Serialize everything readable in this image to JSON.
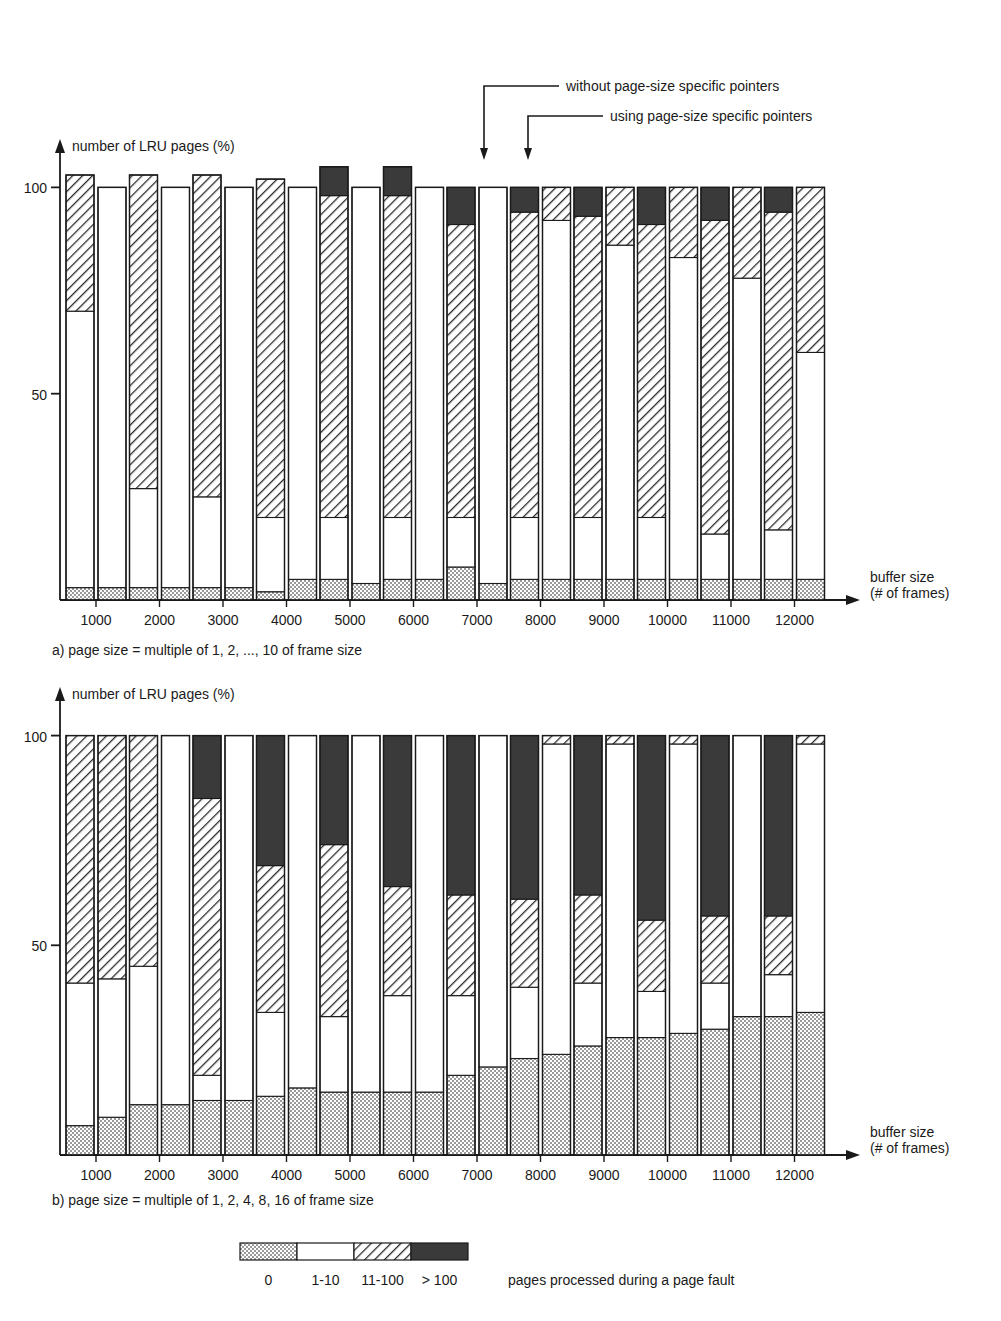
{
  "figure": {
    "annotations": [
      {
        "name": "without-pointers",
        "text": "without page-size specific pointers"
      },
      {
        "name": "using-pointers",
        "text": "using page-size specific pointers"
      }
    ],
    "legend": {
      "title": "pages processed during a page fault",
      "entries": [
        {
          "label": "0",
          "pattern": "dotted-gray",
          "color": "#bfbfbf"
        },
        {
          "label": "1-10",
          "pattern": "white",
          "color": "#ffffff"
        },
        {
          "label": "11-100",
          "pattern": "diagonal-hatch",
          "color": "#ffffff"
        },
        {
          "label": "> 100",
          "pattern": "solid-dark",
          "color": "#3a3a3a"
        }
      ]
    }
  },
  "chart_data": [
    {
      "id": "chart-a",
      "type": "bar",
      "subtype": "grouped-stacked",
      "title": "",
      "caption": "a) page size = multiple of 1, 2, ..., 10 of frame size",
      "ylabel": "number of LRU pages (%)",
      "xlabel": "buffer size",
      "xlabel2": "(# of frames)",
      "ylim": [
        0,
        103
      ],
      "yticks": [
        50,
        100
      ],
      "ytick_labels": [
        "50",
        "100"
      ],
      "grid": false,
      "categories": [
        "1000",
        "2000",
        "3000",
        "4000",
        "5000",
        "6000",
        "7000",
        "8000",
        "9000",
        "10000",
        "11000",
        "12000"
      ],
      "stack_order": [
        "0",
        "1-10",
        "11-100",
        "> 100"
      ],
      "groups": [
        {
          "name": "without page-size specific pointers",
          "bars": [
            {
              "category": "1000",
              "segments": {
                "0": 3,
                "1-10": 67,
                "11-100": 33,
                "> 100": 0
              }
            },
            {
              "category": "2000",
              "segments": {
                "0": 3,
                "1-10": 24,
                "11-100": 76,
                "> 100": 0
              }
            },
            {
              "category": "3000",
              "segments": {
                "0": 3,
                "1-10": 22,
                "11-100": 78,
                "> 100": 0
              }
            },
            {
              "category": "4000",
              "segments": {
                "0": 2,
                "1-10": 18,
                "11-100": 82,
                "> 100": 0
              }
            },
            {
              "category": "5000",
              "segments": {
                "0": 5,
                "1-10": 15,
                "11-100": 78,
                "> 100": 7
              }
            },
            {
              "category": "6000",
              "segments": {
                "0": 5,
                "1-10": 15,
                "11-100": 78,
                "> 100": 7
              }
            },
            {
              "category": "7000",
              "segments": {
                "0": 8,
                "1-10": 12,
                "11-100": 71,
                "> 100": 9
              }
            },
            {
              "category": "8000",
              "segments": {
                "0": 5,
                "1-10": 15,
                "11-100": 74,
                "> 100": 6
              }
            },
            {
              "category": "9000",
              "segments": {
                "0": 5,
                "1-10": 15,
                "11-100": 73,
                "> 100": 7
              }
            },
            {
              "category": "10000",
              "segments": {
                "0": 5,
                "1-10": 15,
                "11-100": 71,
                "> 100": 9
              }
            },
            {
              "category": "11000",
              "segments": {
                "0": 5,
                "1-10": 11,
                "11-100": 76,
                "> 100": 8
              }
            },
            {
              "category": "12000",
              "segments": {
                "0": 5,
                "1-10": 12,
                "11-100": 77,
                "> 100": 6
              }
            }
          ]
        },
        {
          "name": "using page-size specific pointers",
          "bars": [
            {
              "category": "1000",
              "segments": {
                "0": 3,
                "1-10": 97,
                "11-100": 0,
                "> 100": 0
              }
            },
            {
              "category": "2000",
              "segments": {
                "0": 3,
                "1-10": 97,
                "11-100": 0,
                "> 100": 0
              }
            },
            {
              "category": "3000",
              "segments": {
                "0": 3,
                "1-10": 97,
                "11-100": 0,
                "> 100": 0
              }
            },
            {
              "category": "4000",
              "segments": {
                "0": 5,
                "1-10": 95,
                "11-100": 0,
                "> 100": 0
              }
            },
            {
              "category": "5000",
              "segments": {
                "0": 4,
                "1-10": 96,
                "11-100": 0,
                "> 100": 0
              }
            },
            {
              "category": "6000",
              "segments": {
                "0": 5,
                "1-10": 95,
                "11-100": 0,
                "> 100": 0
              }
            },
            {
              "category": "7000",
              "segments": {
                "0": 4,
                "1-10": 96,
                "11-100": 0,
                "> 100": 0
              }
            },
            {
              "category": "8000",
              "segments": {
                "0": 5,
                "1-10": 87,
                "11-100": 8,
                "> 100": 0
              }
            },
            {
              "category": "9000",
              "segments": {
                "0": 5,
                "1-10": 81,
                "11-100": 14,
                "> 100": 0
              }
            },
            {
              "category": "10000",
              "segments": {
                "0": 5,
                "1-10": 78,
                "11-100": 17,
                "> 100": 0
              }
            },
            {
              "category": "11000",
              "segments": {
                "0": 5,
                "1-10": 73,
                "11-100": 22,
                "> 100": 0
              }
            },
            {
              "category": "12000",
              "segments": {
                "0": 5,
                "1-10": 55,
                "11-100": 40,
                "> 100": 0
              }
            }
          ]
        }
      ]
    },
    {
      "id": "chart-b",
      "type": "bar",
      "subtype": "grouped-stacked",
      "title": "",
      "caption": "b) page size = multiple of 1, 2, 4, 8, 16 of frame size",
      "ylabel": "number of LRU pages (%)",
      "xlabel": "buffer size",
      "xlabel2": "(# of frames)",
      "ylim": [
        0,
        103
      ],
      "yticks": [
        50,
        100
      ],
      "ytick_labels": [
        "50",
        "100"
      ],
      "grid": false,
      "categories": [
        "1000",
        "2000",
        "3000",
        "4000",
        "5000",
        "6000",
        "7000",
        "8000",
        "9000",
        "10000",
        "11000",
        "12000"
      ],
      "stack_order": [
        "0",
        "1-10",
        "11-100",
        "> 100"
      ],
      "groups": [
        {
          "name": "without page-size specific pointers",
          "bars": [
            {
              "category": "1000",
              "segments": {
                "0": 7,
                "1-10": 34,
                "11-100": 59,
                "> 100": 0
              }
            },
            {
              "category": "2000",
              "segments": {
                "0": 12,
                "1-10": 33,
                "11-100": 55,
                "> 100": 0
              }
            },
            {
              "category": "3000",
              "segments": {
                "0": 13,
                "1-10": 6,
                "11-100": 66,
                "> 100": 15
              }
            },
            {
              "category": "4000",
              "segments": {
                "0": 14,
                "1-10": 20,
                "11-100": 35,
                "> 100": 31
              }
            },
            {
              "category": "5000",
              "segments": {
                "0": 15,
                "1-10": 18,
                "11-100": 41,
                "> 100": 26
              }
            },
            {
              "category": "6000",
              "segments": {
                "0": 15,
                "1-10": 23,
                "11-100": 26,
                "> 100": 36
              }
            },
            {
              "category": "7000",
              "segments": {
                "0": 19,
                "1-10": 19,
                "11-100": 24,
                "> 100": 38
              }
            },
            {
              "category": "8000",
              "segments": {
                "0": 23,
                "1-10": 17,
                "11-100": 21,
                "> 100": 39
              }
            },
            {
              "category": "9000",
              "segments": {
                "0": 26,
                "1-10": 15,
                "11-100": 21,
                "> 100": 38
              }
            },
            {
              "category": "10000",
              "segments": {
                "0": 28,
                "1-10": 11,
                "11-100": 17,
                "> 100": 44
              }
            },
            {
              "category": "11000",
              "segments": {
                "0": 30,
                "1-10": 11,
                "11-100": 16,
                "> 100": 43
              }
            },
            {
              "category": "12000",
              "segments": {
                "0": 33,
                "1-10": 10,
                "11-100": 14,
                "> 100": 43
              }
            }
          ]
        },
        {
          "name": "using page-size specific pointers",
          "bars": [
            {
              "category": "1000",
              "segments": {
                "0": 9,
                "1-10": 33,
                "11-100": 58,
                "> 100": 0
              }
            },
            {
              "category": "2000",
              "segments": {
                "0": 12,
                "1-10": 88,
                "11-100": 0,
                "> 100": 0
              }
            },
            {
              "category": "3000",
              "segments": {
                "0": 13,
                "1-10": 87,
                "11-100": 0,
                "> 100": 0
              }
            },
            {
              "category": "4000",
              "segments": {
                "0": 16,
                "1-10": 84,
                "11-100": 0,
                "> 100": 0
              }
            },
            {
              "category": "5000",
              "segments": {
                "0": 15,
                "1-10": 85,
                "11-100": 0,
                "> 100": 0
              }
            },
            {
              "category": "6000",
              "segments": {
                "0": 15,
                "1-10": 85,
                "11-100": 0,
                "> 100": 0
              }
            },
            {
              "category": "7000",
              "segments": {
                "0": 21,
                "1-10": 79,
                "11-100": 0,
                "> 100": 0
              }
            },
            {
              "category": "8000",
              "segments": {
                "0": 24,
                "1-10": 74,
                "11-100": 2,
                "> 100": 0
              }
            },
            {
              "category": "9000",
              "segments": {
                "0": 28,
                "1-10": 70,
                "11-100": 2,
                "> 100": 0
              }
            },
            {
              "category": "10000",
              "segments": {
                "0": 29,
                "1-10": 69,
                "11-100": 2,
                "> 100": 0
              }
            },
            {
              "category": "11000",
              "segments": {
                "0": 33,
                "1-10": 67,
                "11-100": 0,
                "> 100": 0
              }
            },
            {
              "category": "12000",
              "segments": {
                "0": 34,
                "1-10": 64,
                "11-100": 2,
                "> 100": 0
              }
            }
          ]
        }
      ]
    }
  ]
}
